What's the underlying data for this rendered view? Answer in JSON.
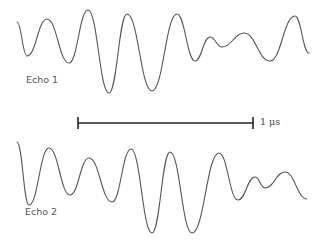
{
  "figure": {
    "traces": [
      {
        "name": "Echo 1",
        "label": "Echo 1",
        "points": [
          [
            17,
            22
          ],
          [
            27,
            56
          ],
          [
            47,
            19
          ],
          [
            69,
            63
          ],
          [
            88,
            10
          ],
          [
            109,
            93
          ],
          [
            127,
            14
          ],
          [
            152,
            91
          ],
          [
            177,
            14
          ],
          [
            195,
            61
          ],
          [
            210,
            37
          ],
          [
            222,
            47
          ],
          [
            244,
            33
          ],
          [
            270,
            61
          ],
          [
            295,
            16
          ],
          [
            309,
            53
          ]
        ]
      },
      {
        "name": "Echo 2",
        "label": "Echo 2",
        "points": [
          [
            17,
            142
          ],
          [
            29,
            205
          ],
          [
            49,
            148
          ],
          [
            70,
            195
          ],
          [
            89,
            158
          ],
          [
            112,
            202
          ],
          [
            131,
            149
          ],
          [
            152,
            233
          ],
          [
            170,
            152
          ],
          [
            192,
            233
          ],
          [
            219,
            153
          ],
          [
            238,
            200
          ],
          [
            255,
            177
          ],
          [
            265,
            188
          ],
          [
            285,
            172
          ],
          [
            307,
            199
          ]
        ]
      }
    ],
    "scale_bar": {
      "label": "1 μs",
      "x1": 78,
      "x2": 253,
      "y": 123
    },
    "colors": {
      "trace": "#555555",
      "scale_bar": "#222222",
      "text": "#555555"
    }
  }
}
